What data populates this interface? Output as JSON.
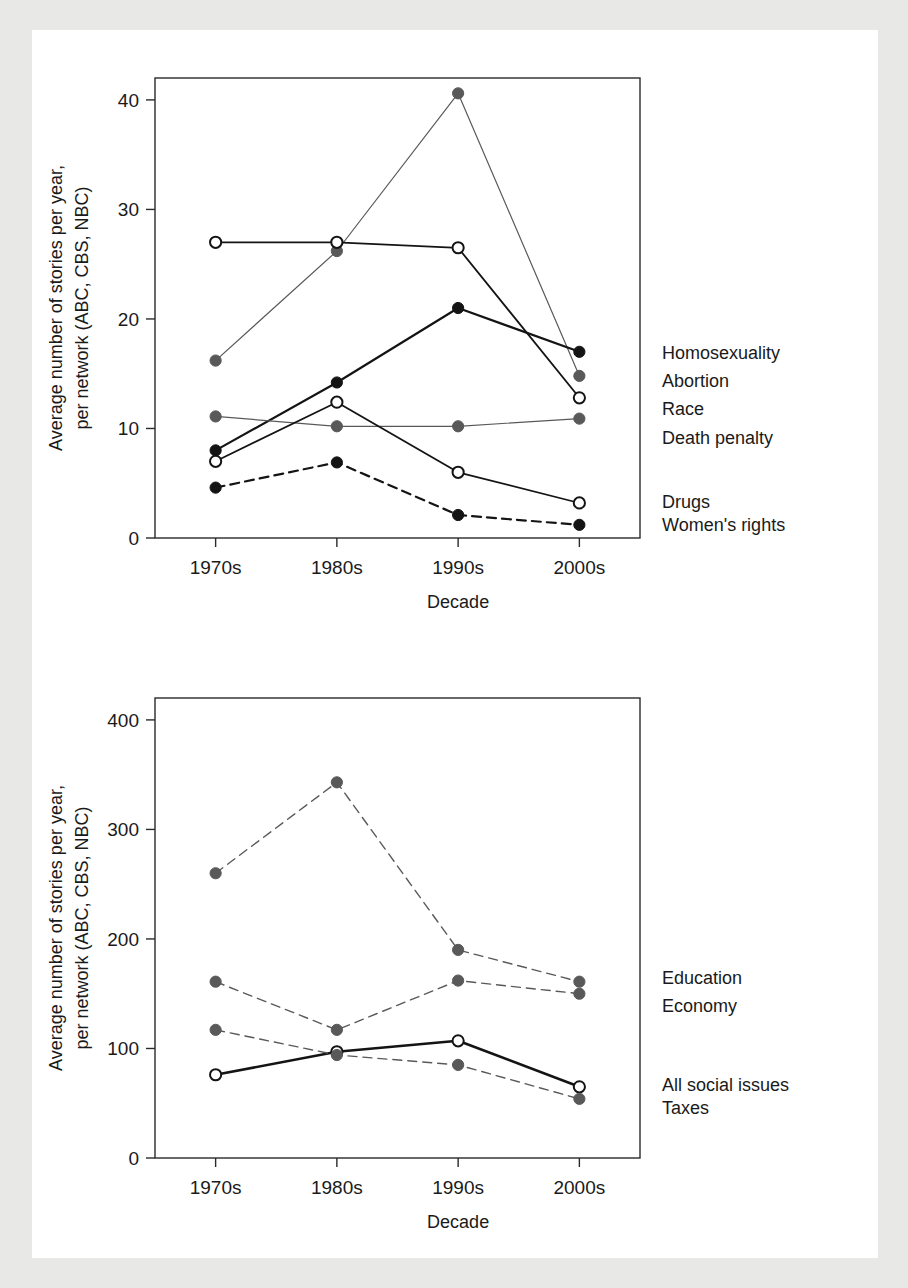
{
  "page": {
    "background_color": "#ffffff",
    "ink_color": "#1a1a1a",
    "scan_edge_color": "#e8e8e6"
  },
  "chart_data": [
    {
      "id": "social-issues-chart",
      "type": "line",
      "title": "",
      "xlabel": "Decade",
      "ylabel": "Average number of stories per year,\nper network (ABC, CBS, NBC)",
      "ylabel_line1": "Average number of stories per year,",
      "ylabel_line2": "per network (ABC, CBS, NBC)",
      "categories": [
        "1970s",
        "1980s",
        "1990s",
        "2000s"
      ],
      "xticks": [
        "1970s",
        "1980s",
        "1990s",
        "2000s"
      ],
      "yticks": [
        "0",
        "10",
        "20",
        "30",
        "40"
      ],
      "ytick_values": [
        0,
        10,
        20,
        30,
        40
      ],
      "ylim": [
        0,
        42
      ],
      "grid": false,
      "legend_position": "right-inline",
      "series": [
        {
          "name": "Homosexuality",
          "values": [
            16.2,
            26.2,
            40.6,
            14.8
          ],
          "marker": "filled-gray",
          "marker_color": "#595959",
          "line_style": "solid",
          "line_color": "#595959",
          "line_width": 1.2,
          "label_y_value": 17.0
        },
        {
          "name": "Abortion",
          "values": [
            8.0,
            14.2,
            21.0,
            17.0
          ],
          "marker": "filled-black",
          "marker_color": "#141414",
          "line_style": "solid",
          "line_color": "#141414",
          "line_width": 2.2,
          "label_y_value": 14.4
        },
        {
          "name": "Race",
          "values": [
            27.0,
            27.0,
            26.5,
            12.8
          ],
          "marker": "open",
          "marker_color": "#141414",
          "line_style": "solid",
          "line_color": "#141414",
          "line_width": 1.8,
          "label_y_value": 11.9
        },
        {
          "name": "Death penalty",
          "values": [
            11.1,
            10.2,
            10.2,
            10.9
          ],
          "marker": "filled-gray",
          "marker_color": "#595959",
          "line_style": "solid",
          "line_color": "#595959",
          "line_width": 1.2,
          "label_y_value": 9.2
        },
        {
          "name": "Drugs",
          "values": [
            7.0,
            12.4,
            6.0,
            3.2
          ],
          "marker": "open",
          "marker_color": "#141414",
          "line_style": "solid",
          "line_color": "#141414",
          "line_width": 1.8,
          "label_y_value": 3.4
        },
        {
          "name": "Women's rights",
          "values": [
            4.6,
            6.9,
            2.1,
            1.2
          ],
          "marker": "filled-black",
          "marker_color": "#141414",
          "line_style": "dashed",
          "line_color": "#141414",
          "line_width": 2.2,
          "label_y_value": 1.3
        }
      ]
    },
    {
      "id": "all-issues-chart",
      "type": "line",
      "title": "",
      "xlabel": "Decade",
      "ylabel": "Average number of stories per year,\nper network (ABC, CBS, NBC)",
      "ylabel_line1": "Average number of stories per year,",
      "ylabel_line2": "per network (ABC, CBS, NBC)",
      "categories": [
        "1970s",
        "1980s",
        "1990s",
        "2000s"
      ],
      "xticks": [
        "1970s",
        "1980s",
        "1990s",
        "2000s"
      ],
      "yticks": [
        "0",
        "100",
        "200",
        "300",
        "400"
      ],
      "ytick_values": [
        0,
        100,
        200,
        300,
        400
      ],
      "ylim": [
        0,
        420
      ],
      "grid": false,
      "legend_position": "right-inline",
      "series": [
        {
          "name": "Education",
          "values": [
            260,
            343,
            190,
            161
          ],
          "marker": "filled-gray",
          "marker_color": "#595959",
          "line_style": "dashed",
          "line_color": "#595959",
          "line_width": 1.4,
          "label_y_value": 165
        },
        {
          "name": "Economy",
          "values": [
            161,
            117,
            162,
            150
          ],
          "marker": "filled-gray",
          "marker_color": "#595959",
          "line_style": "dashed",
          "line_color": "#595959",
          "line_width": 1.4,
          "label_y_value": 140
        },
        {
          "name": "All social issues",
          "values": [
            76,
            97,
            107,
            65
          ],
          "marker": "open",
          "marker_color": "#141414",
          "line_style": "solid",
          "line_color": "#141414",
          "line_width": 2.6,
          "label_y_value": 68
        },
        {
          "name": "Taxes",
          "values": [
            117,
            94,
            85,
            54
          ],
          "marker": "filled-gray",
          "marker_color": "#595959",
          "line_style": "dashed",
          "line_color": "#595959",
          "line_width": 1.4,
          "label_y_value": 47
        }
      ]
    }
  ]
}
